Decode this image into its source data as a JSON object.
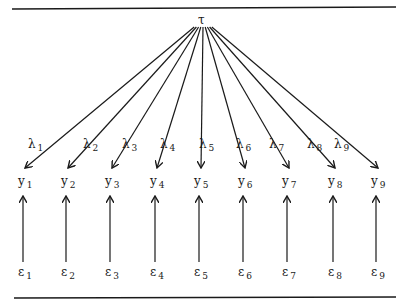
{
  "diagram": {
    "type": "path-diagram",
    "title": "",
    "latent": {
      "symbol": "τ",
      "x": 203,
      "y": 18
    },
    "indicators": [
      {
        "y_label": "y",
        "y_sub": "1",
        "lambda": "λ",
        "lambda_sub": "1",
        "eps": "ε",
        "eps_sub": "1",
        "x": 25,
        "lx": 14,
        "ly": 138
      },
      {
        "y_label": "y",
        "y_sub": "2",
        "lambda": "λ",
        "lambda_sub": "2",
        "eps": "ε",
        "eps_sub": "2",
        "x": 68,
        "lx": 69,
        "ly": 138
      },
      {
        "y_label": "y",
        "y_sub": "3",
        "lambda": "λ",
        "lambda_sub": "3",
        "eps": "ε",
        "eps_sub": "3",
        "x": 112,
        "lx": 108,
        "ly": 138
      },
      {
        "y_label": "y",
        "y_sub": "4",
        "lambda": "λ",
        "lambda_sub": "4",
        "eps": "ε",
        "eps_sub": "4",
        "x": 157,
        "lx": 146,
        "ly": 138
      },
      {
        "y_label": "y",
        "y_sub": "5",
        "lambda": "λ",
        "lambda_sub": "5",
        "eps": "ε",
        "eps_sub": "5",
        "x": 201,
        "lx": 185,
        "ly": 138
      },
      {
        "y_label": "y",
        "y_sub": "6",
        "lambda": "λ",
        "lambda_sub": "6",
        "eps": "ε",
        "eps_sub": "6",
        "x": 245,
        "lx": 222,
        "ly": 138
      },
      {
        "y_label": "y",
        "y_sub": "7",
        "lambda": "λ",
        "lambda_sub": "7",
        "eps": "ε",
        "eps_sub": "7",
        "x": 289,
        "lx": 255,
        "ly": 138
      },
      {
        "y_label": "y",
        "y_sub": "8",
        "lambda": "λ",
        "lambda_sub": "8",
        "eps": "ε",
        "eps_sub": "8",
        "x": 335,
        "lx": 293,
        "ly": 138
      },
      {
        "y_label": "y",
        "y_sub": "9",
        "lambda": "λ",
        "lambda_sub": "9",
        "eps": "ε",
        "eps_sub": "9",
        "x": 378,
        "lx": 320,
        "ly": 138
      }
    ],
    "colors": {
      "line": "#1a1a1a",
      "background": "#ffffff"
    }
  }
}
